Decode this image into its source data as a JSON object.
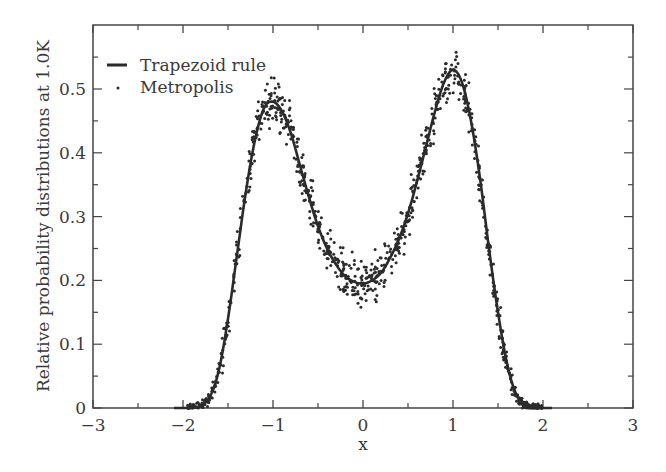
{
  "chart_data": {
    "type": "line",
    "title": "",
    "xlabel": "x",
    "ylabel": "Relative probability distributions at 1.0K",
    "xlim": [
      -3,
      3
    ],
    "ylim": [
      0,
      0.6
    ],
    "x_ticks": [
      "-3",
      "-2",
      "-1",
      "0",
      "1",
      "2",
      "3"
    ],
    "y_ticks": [
      "0",
      "0.1",
      "0.2",
      "0.3",
      "0.4",
      "0.5"
    ],
    "grid": false,
    "legend_position": "upper-left",
    "legend": [
      {
        "label": "Trapezoid rule",
        "style": "line"
      },
      {
        "label": "Metropolis",
        "style": "dots"
      }
    ],
    "series": [
      {
        "name": "Trapezoid rule",
        "style": "solid-line",
        "x": [
          -2.1,
          -2.0,
          -1.9,
          -1.8,
          -1.7,
          -1.6,
          -1.5,
          -1.4,
          -1.3,
          -1.2,
          -1.1,
          -1.0,
          -0.9,
          -0.8,
          -0.7,
          -0.6,
          -0.5,
          -0.4,
          -0.3,
          -0.2,
          -0.1,
          0.0,
          0.1,
          0.2,
          0.3,
          0.4,
          0.5,
          0.6,
          0.7,
          0.8,
          0.9,
          1.0,
          1.1,
          1.2,
          1.3,
          1.4,
          1.5,
          1.6,
          1.7,
          1.8,
          1.9,
          2.0,
          2.1
        ],
        "values": [
          0.0,
          0.0,
          0.001,
          0.004,
          0.018,
          0.06,
          0.14,
          0.24,
          0.34,
          0.42,
          0.47,
          0.48,
          0.465,
          0.43,
          0.38,
          0.33,
          0.285,
          0.25,
          0.225,
          0.207,
          0.198,
          0.195,
          0.2,
          0.212,
          0.235,
          0.265,
          0.305,
          0.355,
          0.41,
          0.465,
          0.51,
          0.53,
          0.51,
          0.45,
          0.36,
          0.25,
          0.15,
          0.07,
          0.022,
          0.005,
          0.001,
          0.0,
          0.0
        ]
      },
      {
        "name": "Metropolis",
        "style": "scatter-dots",
        "description": "Monte Carlo samples scattered around the trapezoid-rule curve with noise up to about ±0.03; peaks reach ~0.52 near x=-1 and ~0.58 near x=1; minimum ~0.18 near x=0"
      }
    ]
  },
  "colors": {
    "ink": "#2b2b2b",
    "axis": "#444444",
    "background": "#ffffff"
  }
}
